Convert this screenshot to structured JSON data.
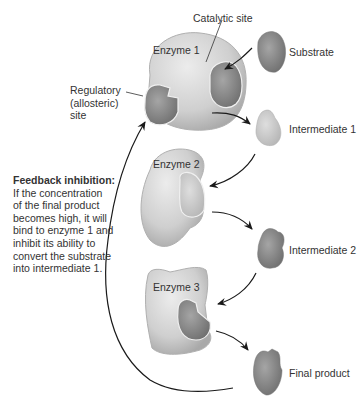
{
  "labels": {
    "catalytic_site": "Catalytic site",
    "regulatory_site": [
      "Regulatory",
      "(allosteric)",
      "site"
    ],
    "substrate": "Substrate",
    "intermediate_1": "Intermediate 1",
    "intermediate_2": "Intermediate 2",
    "final_product": "Final product"
  },
  "enzymes": [
    {
      "label": "Enzyme 1"
    },
    {
      "label": "Enzyme 2"
    },
    {
      "label": "Enzyme 3"
    }
  ],
  "feedback_note": {
    "title": "Feedback inhibition:",
    "lines": [
      "If the concentration",
      "of the final product",
      "becomes high, it will",
      "bind to enzyme 1 and",
      "inhibit its ability to",
      "convert the substrate",
      "into intermediate 1."
    ]
  },
  "colors": {
    "enzyme_fill": "#d4d4d4",
    "molecule_fill": "#8a8a8a",
    "arrow": "#1a1a1a",
    "text": "#333333"
  }
}
